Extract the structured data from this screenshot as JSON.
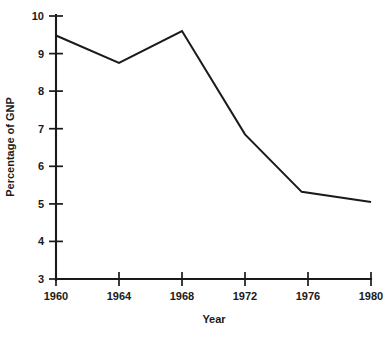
{
  "chart_data": {
    "type": "line",
    "title": "",
    "xlabel": "Year",
    "ylabel": "Percentage of GNP",
    "x": [
      1960,
      1964,
      1968,
      1972,
      1975.6,
      1980
    ],
    "values": [
      9.48,
      8.75,
      9.6,
      6.85,
      5.32,
      5.05
    ],
    "series": [
      {
        "name": "Percentage of GNP",
        "color": "#1a1a1a",
        "points": [
          {
            "x": 1960,
            "y": 9.48
          },
          {
            "x": 1964,
            "y": 8.75
          },
          {
            "x": 1968,
            "y": 9.6
          },
          {
            "x": 1972,
            "y": 6.85
          },
          {
            "x": 1975.6,
            "y": 5.32
          },
          {
            "x": 1980,
            "y": 5.05
          }
        ]
      }
    ],
    "xlim": [
      1960,
      1980
    ],
    "ylim": [
      3,
      10
    ],
    "xticks": [
      1960,
      1964,
      1968,
      1972,
      1976,
      1980
    ],
    "xtick_labels": [
      "1960",
      "1964",
      "1968",
      "1972",
      "1976",
      "1980"
    ],
    "yticks": [
      3,
      4,
      5,
      6,
      7,
      8,
      9,
      10
    ],
    "ytick_labels": [
      "3",
      "4",
      "5",
      "6",
      "7",
      "8",
      "9",
      "10"
    ],
    "grid": false,
    "legend": "none",
    "annotations": []
  },
  "axis": {
    "y_title": "Percentage of GNP",
    "x_title": "Year",
    "y_ticks": [
      "10",
      "9",
      "8",
      "7",
      "6",
      "5",
      "4",
      "3"
    ],
    "x_ticks": [
      "1960",
      "1964",
      "1968",
      "1972",
      "1976",
      "1980"
    ]
  },
  "ghost": {
    "top_fragment": "",
    "bottom_fragment": ""
  }
}
